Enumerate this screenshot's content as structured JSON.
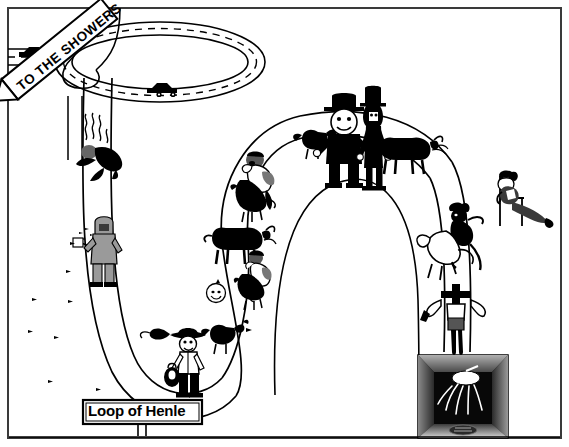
{
  "figure": {
    "title_sign": "Loop of Henle",
    "direction_sign": "TO THE SHOWERS",
    "frame": {
      "border_color": "#3a3a3a",
      "background": "#ffffff"
    },
    "palette": {
      "ink": "#000000",
      "paper": "#ffffff",
      "mid_gray": "#808080",
      "dark_gray": "#3a3a3a",
      "light_gray": "#c8c8c8"
    },
    "elements": {
      "highway_loop": {
        "name": "cloverleaf-highway-loop",
        "lane_marking": "dashed-center-line",
        "vehicles": 2
      },
      "tubule": {
        "name": "nephron-tubule-loop",
        "description": "descending and ascending limbs forming a U shape"
      },
      "shower_stall": {
        "name": "shower-stall",
        "description": "showerhead spraying water inside a dark booth"
      }
    },
    "characters": [
      {
        "id": "diver",
        "label": "diving-figure-with-heat-lines"
      },
      {
        "id": "hazmat",
        "label": "hazmat-suited-worker-with-sprayer"
      },
      {
        "id": "rodeo-rider-upper",
        "label": "rodeo-rider-on-bucking-animal"
      },
      {
        "id": "rodeo-rider-lower",
        "label": "rodeo-rider-lower"
      },
      {
        "id": "bull-upper-right",
        "label": "steaming-bull"
      },
      {
        "id": "bull-left",
        "label": "steaming-bull-left"
      },
      {
        "id": "chicken-upper",
        "label": "chicken-upper"
      },
      {
        "id": "chicken-lower",
        "label": "chicken-lower"
      },
      {
        "id": "round-man-hat",
        "label": "round-man-in-bowler-hat"
      },
      {
        "id": "tall-man-hat",
        "label": "tall-man-in-top-hat"
      },
      {
        "id": "cowboy",
        "label": "cowboy-with-hat-and-bag"
      },
      {
        "id": "lounger",
        "label": "person-reclining-in-chair"
      },
      {
        "id": "bronco-rider-right",
        "label": "bronco-rider-right"
      },
      {
        "id": "falling-figure",
        "label": "falling-figure-above-shower"
      }
    ]
  }
}
